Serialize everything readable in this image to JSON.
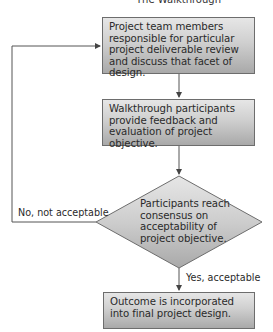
{
  "diagram": {
    "title": "The Walkthrough",
    "nodes": [
      {
        "id": "review",
        "shape": "rectangle",
        "text": "Project team members responsible for particular project deliverable review and discuss that facet of design."
      },
      {
        "id": "feedback",
        "shape": "rectangle",
        "text": "Walkthrough participants provide feedback and evaluation of project objective."
      },
      {
        "id": "decision",
        "shape": "diamond",
        "text": "Participants reach consensus on acceptability of project objective."
      },
      {
        "id": "outcome",
        "shape": "rectangle",
        "text": "Outcome is incorporated into final project design."
      }
    ],
    "edges": [
      {
        "from": "review",
        "to": "feedback",
        "label": ""
      },
      {
        "from": "feedback",
        "to": "decision",
        "label": ""
      },
      {
        "from": "decision",
        "to": "outcome",
        "label": "Yes, acceptable"
      },
      {
        "from": "decision",
        "to": "review",
        "label": "No, not acceptable"
      }
    ],
    "colors": {
      "box_gradient_top": "#e6e6e6",
      "box_gradient_bottom": "#a9a9a9",
      "border": "#6d6d6d",
      "line": "#555555"
    }
  }
}
